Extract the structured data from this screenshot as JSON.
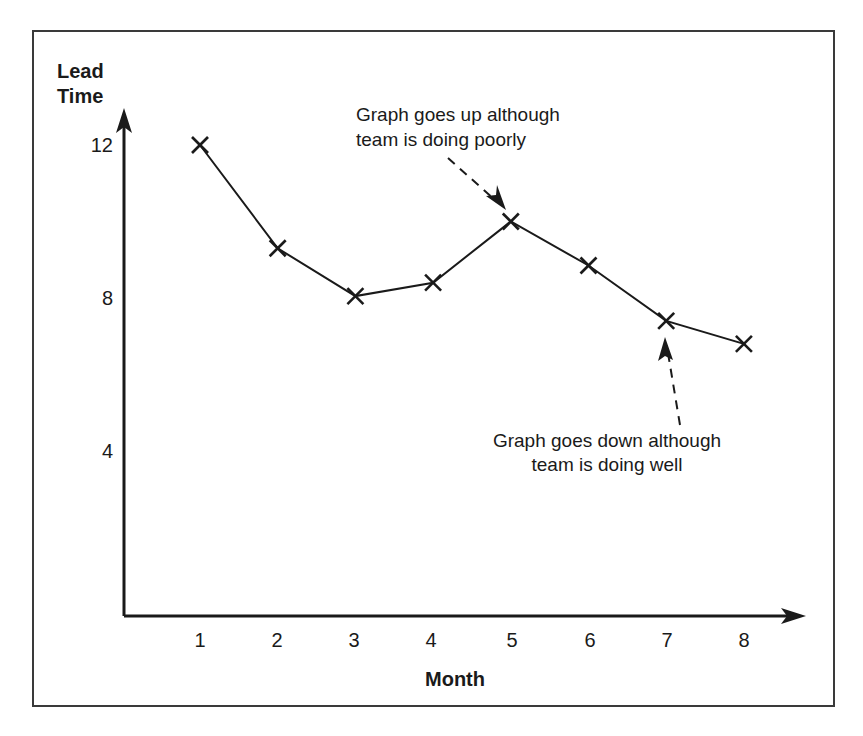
{
  "chart_data": {
    "type": "line",
    "title": "",
    "xlabel": "Month",
    "ylabel": "Lead Time",
    "x": [
      1,
      2,
      3,
      4,
      5,
      6,
      7,
      8
    ],
    "categories": [
      "1",
      "2",
      "3",
      "4",
      "5",
      "6",
      "7",
      "8"
    ],
    "values": [
      12.0,
      9.3,
      8.05,
      8.4,
      10.0,
      8.85,
      7.4,
      6.8
    ],
    "series": [
      {
        "name": "Lead Time",
        "values": [
          12.0,
          9.3,
          8.05,
          8.4,
          10.0,
          8.85,
          7.4,
          6.8
        ]
      }
    ],
    "xlim": [
      0.55,
      8.6
    ],
    "ylim": [
      0,
      13.2
    ],
    "x_tick_labels": [
      "1",
      "2",
      "3",
      "4",
      "5",
      "6",
      "7",
      "8"
    ],
    "y_tick_labels": [
      "12",
      "8",
      "4"
    ],
    "y_tick_values": [
      12,
      8,
      4
    ],
    "grid": false,
    "legend": false,
    "marker": "x",
    "line_color": "#1a1a1a",
    "annotations": [
      {
        "id": "annotation-up",
        "text_line1": "Graph goes up although",
        "text_line2": "team is doing poorly",
        "points_to_x": 5,
        "points_to_y": 10.0
      },
      {
        "id": "annotation-down",
        "text_line1": "Graph goes down although",
        "text_line2": "team is doing well",
        "points_to_x": 7,
        "points_to_y": 7.4
      }
    ]
  },
  "axes": {
    "y_title_line1": "Lead",
    "y_title_line2": "Time",
    "x_title": "Month"
  }
}
